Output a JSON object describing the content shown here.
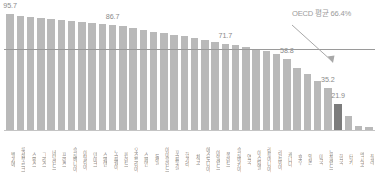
{
  "chart_data": {
    "type": "bar",
    "title": "",
    "subtitle": "",
    "xlabel": "",
    "ylabel": "",
    "ylim": [
      0,
      100
    ],
    "grid": false,
    "legend": "none",
    "orientation": "vertical",
    "sort": "descending",
    "bar_color": "#b9b9b9",
    "highlight_color": "#7c7c7c",
    "highlight_category": "한국",
    "reference_line": {
      "value": 66.4,
      "label": "OECD 평균 66.4%",
      "color": "#9a9a9a",
      "annotation_arrow": true
    },
    "categories": [
      "벨기에",
      "룩셈부르크",
      "스위스",
      "그리스",
      "네덜란드",
      "프랑스",
      "슬로베니아",
      "이탈리아",
      "덴마크",
      "스웨덴",
      "노르웨이",
      "핀란드",
      "오스트리아",
      "스페인",
      "독일",
      "아이슬란드",
      "포르투갈",
      "헝가리",
      "체코",
      "에스토니아",
      "아일랜드",
      "폴란드",
      "슬로바키아",
      "영국",
      "이스라엘",
      "리투아니아",
      "라트비아",
      "캐나다",
      "호주",
      "일본",
      "미국",
      "뉴질랜드",
      "한국",
      "터키",
      "멕시코",
      "칠레"
    ],
    "values": [
      95.7,
      94.6,
      93.4,
      92.5,
      91.6,
      90.8,
      89.9,
      89.1,
      88.2,
      87.4,
      86.7,
      86.0,
      84.2,
      82.8,
      81.5,
      80.2,
      79.0,
      77.6,
      76.2,
      74.8,
      73.3,
      71.7,
      70.2,
      68.6,
      67.0,
      65.4,
      63.0,
      58.8,
      52.0,
      46.5,
      41.0,
      35.2,
      21.9,
      12.0,
      4.5,
      3.2
    ],
    "value_labels": [
      {
        "index": 0,
        "text": "95.7"
      },
      {
        "index": 10,
        "text": "86.7"
      },
      {
        "index": 21,
        "text": "71.7"
      },
      {
        "index": 27,
        "text": "58.8"
      },
      {
        "index": 31,
        "text": "35.2"
      },
      {
        "index": 32,
        "text": "21.9"
      }
    ]
  }
}
